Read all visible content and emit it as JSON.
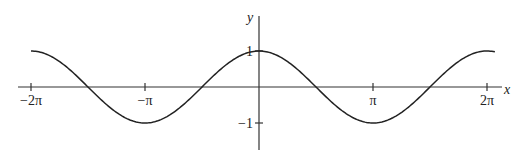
{
  "chart_data": {
    "type": "line",
    "title": "",
    "function": "y = cos(x)",
    "xlabel": "x",
    "ylabel": "y",
    "xlim": [
      -6.38,
      6.9
    ],
    "ylim": [
      -1.75,
      2.0
    ],
    "x_ticks": [
      {
        "value": -6.283185,
        "label": "−2π"
      },
      {
        "value": -3.141593,
        "label": "−π"
      },
      {
        "value": 3.141593,
        "label": "π"
      },
      {
        "value": 6.283185,
        "label": "2π"
      }
    ],
    "y_ticks": [
      {
        "value": 1,
        "label": "1"
      },
      {
        "value": -1,
        "label": "−1"
      }
    ],
    "grid": false,
    "legend": null,
    "series": [
      {
        "name": "cos(x)",
        "x_range": [
          -6.283185,
          6.5
        ],
        "x": [
          -6.283,
          -4.712,
          -3.142,
          -1.571,
          0,
          1.571,
          3.142,
          4.712,
          6.283
        ],
        "values": [
          1,
          0,
          -1,
          0,
          1,
          0,
          -1,
          0,
          1
        ]
      }
    ],
    "style": {
      "line_color": "#222222",
      "axis_color": "#333333"
    }
  }
}
